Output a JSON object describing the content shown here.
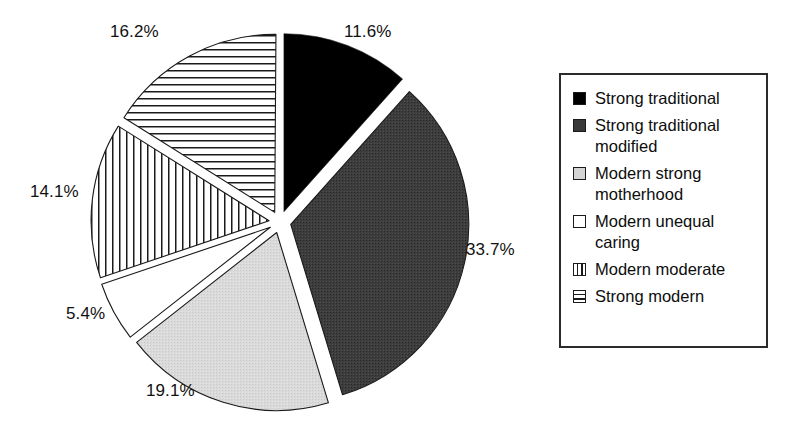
{
  "chart_data": {
    "type": "pie",
    "title": "",
    "subtitle": "",
    "xlabel": "",
    "ylabel": "",
    "legend_position": "right",
    "grid": false,
    "exploded": true,
    "start_angle_deg": 0,
    "direction": "clockwise",
    "categories": [
      "Strong traditional",
      "Strong traditional modified",
      "Modern strong motherhood",
      "Modern unequal caring",
      "Modern moderate",
      "Strong modern"
    ],
    "values": [
      11.6,
      33.7,
      19.1,
      5.4,
      14.1,
      16.2
    ],
    "value_labels": [
      "11.6%",
      "33.7%",
      "19.1%",
      "5.4%",
      "14.1%",
      "16.2%"
    ],
    "unit": "%",
    "slice_styles": [
      "solid-black",
      "dark-gray",
      "light-gray",
      "white",
      "vertical-lines",
      "horizontal-lines"
    ],
    "slice_colors": [
      "#000000",
      "#3a3a3a",
      "#d6d6d6",
      "#ffffff",
      "#ffffff",
      "#ffffff"
    ]
  },
  "pie": {
    "center_x": 280,
    "center_y": 222,
    "radius": 178,
    "explode_offset": 11,
    "slices": [
      {
        "label": "Strong traditional",
        "value": 11.6,
        "pct_text": "11.6%",
        "style": "solid-black",
        "fill": "#000000",
        "start": 0.0,
        "end": 41.8,
        "label_x": 344,
        "label_y": 22
      },
      {
        "label": "Strong traditional modified",
        "value": 33.7,
        "pct_text": "33.7%",
        "style": "dark-gray",
        "fill": "#3a3a3a",
        "start": 41.8,
        "end": 163.1,
        "label_x": 466,
        "label_y": 240
      },
      {
        "label": "Modern strong motherhood",
        "value": 19.1,
        "pct_text": "19.1%",
        "style": "light-gray",
        "fill": "#d6d6d6",
        "start": 163.1,
        "end": 231.9,
        "label_x": 146,
        "label_y": 381
      },
      {
        "label": "Modern unequal caring",
        "value": 5.4,
        "pct_text": "5.4%",
        "style": "white",
        "fill": "#ffffff",
        "start": 231.9,
        "end": 251.3,
        "label_x": 66,
        "label_y": 304
      },
      {
        "label": "Modern moderate",
        "value": 14.1,
        "pct_text": "14.1%",
        "style": "vertical-lines",
        "fill": "#ffffff",
        "start": 251.3,
        "end": 302.1,
        "label_x": 30,
        "label_y": 182
      },
      {
        "label": "Strong modern",
        "value": 16.2,
        "pct_text": "16.2%",
        "style": "horizontal-lines",
        "fill": "#ffffff",
        "start": 302.1,
        "end": 360.4,
        "label_x": 110,
        "label_y": 22
      }
    ]
  },
  "legend": {
    "items": [
      {
        "label": "Strong traditional",
        "swatch": "solid-black"
      },
      {
        "label": "Strong traditional\nmodified",
        "swatch": "dark-gray"
      },
      {
        "label": "Modern strong\nmotherhood",
        "swatch": "light-gray"
      },
      {
        "label": "Modern unequal\ncaring",
        "swatch": "white"
      },
      {
        "label": "Modern moderate",
        "swatch": "vertical-lines"
      },
      {
        "label": "Strong modern",
        "swatch": "horizontal-lines"
      }
    ]
  }
}
